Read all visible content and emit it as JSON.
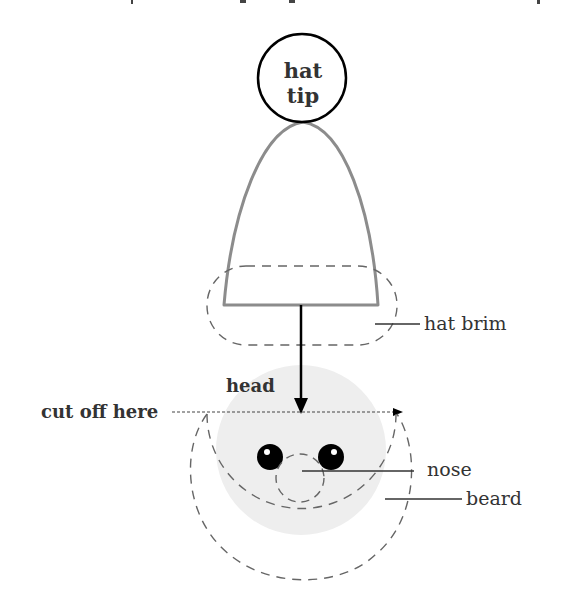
{
  "diagram": {
    "type": "labeled illustration",
    "labels": {
      "hat_tip": [
        "hat",
        "tip"
      ],
      "hat_brim": "hat brim",
      "head": "head",
      "cut_off": "cut off here",
      "nose": "nose",
      "beard": "beard"
    },
    "colors": {
      "outline": "#000000",
      "hat_stroke": "#8c8c8c",
      "dashed": "#666666",
      "head_fill": "#eeeeee",
      "text": "#333333"
    }
  }
}
